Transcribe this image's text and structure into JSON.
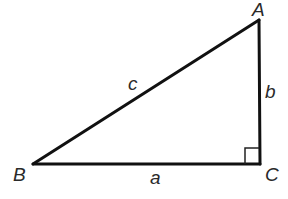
{
  "diagram": {
    "type": "right-triangle",
    "vertices": {
      "A": {
        "label": "A",
        "x": 259,
        "y": 20
      },
      "B": {
        "label": "B",
        "x": 33,
        "y": 164
      },
      "C": {
        "label": "C",
        "x": 260,
        "y": 164
      }
    },
    "sides": {
      "a": {
        "label": "a",
        "from": "B",
        "to": "C"
      },
      "b": {
        "label": "b",
        "from": "C",
        "to": "A"
      },
      "c": {
        "label": "c",
        "from": "B",
        "to": "A"
      }
    },
    "right_angle_at": "C",
    "colors": {
      "stroke": "#111111",
      "label": "#2a2a2a",
      "background": "#ffffff"
    }
  }
}
